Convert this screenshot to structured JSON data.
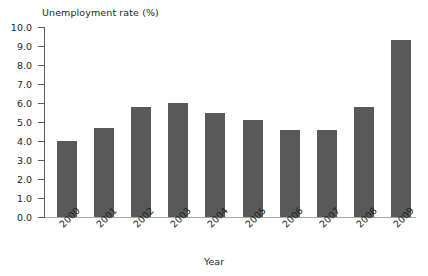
{
  "chart_data": {
    "type": "bar",
    "title": "",
    "ylabel": "Unemployment rate (%)",
    "xlabel": "Year",
    "categories": [
      "2000",
      "2001",
      "2002",
      "2003",
      "2004",
      "2005",
      "2006",
      "2007",
      "2008",
      "2009"
    ],
    "values": [
      4.0,
      4.7,
      5.8,
      6.0,
      5.5,
      5.1,
      4.6,
      4.6,
      5.8,
      9.3
    ],
    "ylim": [
      0.0,
      10.0
    ],
    "ytick_labels": [
      "0.0",
      "1.0",
      "2.0",
      "3.0",
      "4.0",
      "5.0",
      "6.0",
      "7.0",
      "8.0",
      "9.0",
      "10.0"
    ],
    "ytick_values": [
      0.0,
      1.0,
      2.0,
      3.0,
      4.0,
      5.0,
      6.0,
      7.0,
      8.0,
      9.0,
      10.0
    ],
    "grid": false,
    "legend": "none",
    "bar_color": "#595959",
    "axis_color": "#58595b",
    "text_color": "#231f20"
  }
}
